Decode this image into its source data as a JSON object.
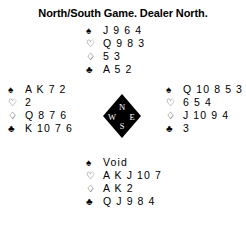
{
  "board": {
    "title": "North/South Game. Dealer North.",
    "background_color": "#ffffff",
    "text_color": "#000000"
  },
  "suits": {
    "spade": {
      "symbol": "♠",
      "name": "spade-symbol",
      "style": "filled"
    },
    "heart": {
      "symbol": "♡",
      "name": "heart-symbol",
      "style": "hollow"
    },
    "diamond": {
      "symbol": "♢",
      "name": "diamond-symbol",
      "style": "hollow"
    },
    "club": {
      "symbol": "♣",
      "name": "club-symbol",
      "style": "filled"
    }
  },
  "hands": {
    "north": {
      "label": "North",
      "spades": "J 9 6 4",
      "hearts": "Q 9 8 3",
      "diamonds": "5 3",
      "clubs": "A 5 2"
    },
    "west": {
      "label": "West",
      "spades": "A K 7 2",
      "hearts": "2",
      "diamonds": "Q 8 7 6",
      "clubs": "K 10 7 6"
    },
    "east": {
      "label": "East",
      "spades": "Q 10 8 5 3",
      "hearts": "6 5 4",
      "diamonds": "J 10 9 4",
      "clubs": "3"
    },
    "south": {
      "label": "South",
      "spades": "Void",
      "hearts": "A K J 10 7",
      "diamonds": "A K 2",
      "clubs": "Q J 9 8 4"
    }
  },
  "compass": {
    "north": "N",
    "west": "W",
    "east": "E",
    "south": "S",
    "fill_color": "#000000",
    "letter_color": "#ffffff"
  }
}
